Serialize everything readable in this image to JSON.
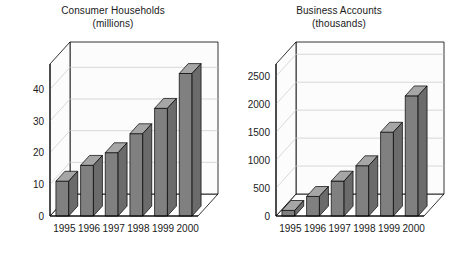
{
  "page": {
    "background": "#ffffff",
    "width": 452,
    "height": 254
  },
  "style": {
    "bar_face_color": "#808080",
    "bar_top_color": "#a6a6a6",
    "bar_side_color": "#6b6b6b",
    "axis_color": "#000000",
    "grid_color": "#c8c8c8",
    "wall_color": "#fcfcfc",
    "floor_color": "#ffffff",
    "text_color": "#1a1a1a"
  },
  "charts": [
    {
      "id": "consumer-households",
      "title_line1": "Consumer Households",
      "title_line2": "(millions)"
    },
    {
      "id": "business-accounts",
      "title_line1": "Business Accounts",
      "title_line2": "(thousands)"
    }
  ],
  "chart_data": [
    {
      "type": "bar",
      "id": "consumer-households",
      "title": "Consumer Households (millions)",
      "subtitle": "(millions)",
      "xlabel": "",
      "ylabel": "",
      "categories": [
        "1995",
        "1996",
        "1997",
        "1998",
        "1999",
        "2000"
      ],
      "values": [
        11,
        16,
        20,
        26,
        34,
        45
      ],
      "yticks": [
        0,
        10,
        20,
        30,
        40
      ],
      "yticklabels": [
        "0",
        "10",
        "20",
        "30",
        "40"
      ],
      "ylim": [
        0,
        48
      ],
      "grid": true,
      "legend": false,
      "style3d": true
    },
    {
      "type": "bar",
      "id": "business-accounts",
      "title": "Business Accounts (thousands)",
      "subtitle": "(thousands)",
      "xlabel": "",
      "ylabel": "",
      "categories": [
        "1995",
        "1996",
        "1997",
        "1998",
        "1999",
        "2000"
      ],
      "values": [
        100,
        350,
        625,
        900,
        1500,
        2150
      ],
      "yticks": [
        0,
        500,
        1000,
        1500,
        2000,
        2500
      ],
      "yticklabels": [
        "0",
        "500",
        "1000",
        "1500",
        "2000",
        "2500"
      ],
      "ylim": [
        0,
        2720
      ],
      "grid": true,
      "legend": false,
      "style3d": true
    }
  ]
}
